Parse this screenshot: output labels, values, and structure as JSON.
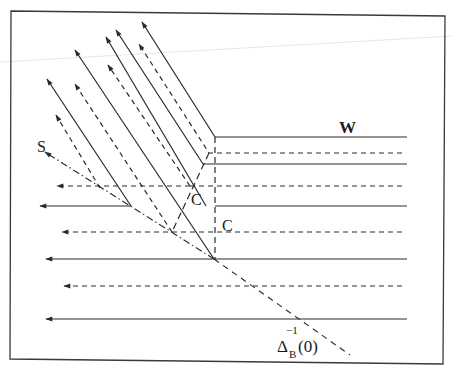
{
  "figure": {
    "type": "line-drawing diagram",
    "labels": {
      "W": "W",
      "S": "S",
      "C1": "C",
      "C2": "C",
      "delta_base": "Δ",
      "delta_sub": "B",
      "delta_sup": "−1",
      "delta_arg": "(0)"
    },
    "colors": {
      "stroke": "#2a2a2a",
      "frame": "#3a3a3a",
      "background": "#ffffff"
    },
    "frame": {
      "points": "11,11 445,16 443,364 10,359"
    },
    "corner": {
      "x": 215,
      "y": 137
    },
    "horizontal_lines": [
      {
        "style": "solid",
        "y": 137,
        "x_start": 215,
        "x_end": 407,
        "arrow": false
      },
      {
        "style": "dashed",
        "y": 153,
        "x_start": 209,
        "x_end": 402,
        "arrow": false
      },
      {
        "style": "solid",
        "y": 164,
        "x_start": 203,
        "x_end": 407,
        "arrow": false
      },
      {
        "style": "dashed",
        "y": 186,
        "x_start": 190,
        "x_end": 402,
        "turn_x": 100,
        "arrow_x": 57
      },
      {
        "style": "solid",
        "y": 206,
        "x_start": 131,
        "x_end": 407,
        "arrow_x": 40
      },
      {
        "style": "dashed",
        "y": 232,
        "x_start": 172,
        "x_end": 402,
        "arrow_x": 62
      },
      {
        "style": "solid",
        "y": 259,
        "x_start": 46,
        "x_end": 407,
        "arrow_x": 46
      },
      {
        "style": "dashed",
        "y": 286,
        "x_start": 64,
        "x_end": 402,
        "arrow_x": 64
      },
      {
        "style": "solid",
        "y": 319,
        "x_start": 46,
        "x_end": 407,
        "arrow_x": 46
      }
    ],
    "diagonal_rays": [
      {
        "style": "solid",
        "from": [
          215,
          137
        ],
        "to": [
          142,
          22
        ]
      },
      {
        "style": "dashed",
        "from": [
          209,
          153
        ],
        "to": [
          139,
          44
        ]
      },
      {
        "style": "solid",
        "from": [
          203,
          164
        ],
        "to": [
          116,
          30
        ]
      },
      {
        "style": "solid",
        "from": [
          190,
          186
        ],
        "to": [
          106,
          37
        ]
      },
      {
        "style": "dashed",
        "from": [
          172,
          232
        ],
        "to": [
          108,
          65
        ]
      },
      {
        "style": "solid",
        "from": [
          214,
          259
        ],
        "to": [
          75,
          50
        ]
      },
      {
        "style": "dashed",
        "from": [
          131,
          206
        ],
        "to": [
          75,
          84
        ]
      },
      {
        "style": "solid",
        "from": [
          131,
          206
        ],
        "to": [
          47,
          79
        ]
      },
      {
        "style": "dashed",
        "from": [
          100,
          188
        ],
        "to": [
          56,
          115
        ]
      }
    ],
    "dash_dot_line_S": {
      "from": [
        214,
        259
      ],
      "to": [
        45,
        152
      ]
    },
    "dashed_line_delta": {
      "from": [
        214,
        259
      ],
      "to": [
        350,
        355
      ]
    },
    "vertical_dashed": {
      "x": 215,
      "y_start": 137,
      "y_end": 259
    },
    "C_dashed_line": {
      "from": [
        172,
        232
      ],
      "to": [
        209,
        153
      ]
    }
  }
}
